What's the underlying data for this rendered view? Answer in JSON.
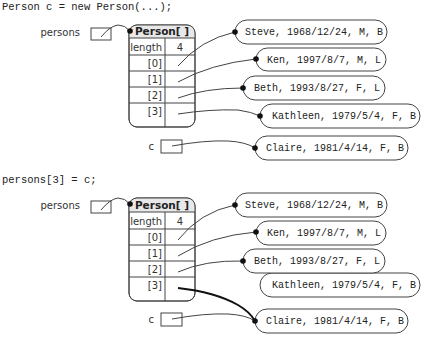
{
  "diagrams": [
    {
      "code": "Person c = new Person(...);",
      "persons_label": "persons",
      "c_label": "c",
      "array": {
        "header": "Person[ ]",
        "length_label": "length",
        "length_value": "4",
        "indices": [
          "[0]",
          "[1]",
          "[2]",
          "[3]"
        ]
      },
      "objects": [
        "Steve, 1968/12/24, M, B",
        "Ken, 1997/8/7, M, L",
        "Beth, 1993/8/27, F, L",
        "Kathleen, 1979/5/4, F, B",
        "Claire, 1981/4/14, F, B"
      ]
    },
    {
      "code": "persons[3] = c;",
      "persons_label": "persons",
      "c_label": "c",
      "array": {
        "header": "Person[ ]",
        "length_label": "length",
        "length_value": "4",
        "indices": [
          "[0]",
          "[1]",
          "[2]",
          "[3]"
        ]
      },
      "objects": [
        "Steve, 1968/12/24, M, B",
        "Ken, 1997/8/7, M, L",
        "Beth, 1993/8/27, F, L",
        "Kathleen, 1979/5/4, F, B",
        "Claire, 1981/4/14, F, B"
      ]
    }
  ],
  "colors": {
    "stroke": "#444444",
    "header_fill": "#e8e8e8",
    "background": "#ffffff"
  }
}
